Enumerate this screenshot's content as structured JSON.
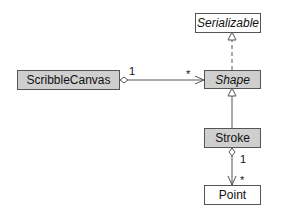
{
  "diagram": {
    "type": "UML class diagram",
    "classes": [
      {
        "id": "serializable",
        "name": "Serializable",
        "abstract": true,
        "kind": "interface"
      },
      {
        "id": "shape",
        "name": "Shape",
        "abstract": true
      },
      {
        "id": "scribble_canvas",
        "name": "ScribbleCanvas",
        "abstract": false
      },
      {
        "id": "stroke",
        "name": "Stroke",
        "abstract": false
      },
      {
        "id": "point",
        "name": "Point",
        "abstract": false
      }
    ],
    "relations": [
      {
        "type": "realization",
        "from": "Shape",
        "to": "Serializable"
      },
      {
        "type": "aggregation",
        "from": "ScribbleCanvas",
        "to": "Shape",
        "source_mult": "1",
        "target_mult": "*"
      },
      {
        "type": "generalization",
        "from": "Stroke",
        "to": "Shape"
      },
      {
        "type": "aggregation",
        "from": "Stroke",
        "to": "Point",
        "source_mult": "1",
        "target_mult": "*"
      }
    ]
  },
  "labels": {
    "serializable": "Serializable",
    "shape": "Shape",
    "scribble_canvas": "ScribbleCanvas",
    "stroke": "Stroke",
    "point": "Point",
    "canvas_mult_source": "1",
    "canvas_mult_target": "*",
    "stroke_mult_source": "1",
    "stroke_mult_target": "*"
  },
  "colors": {
    "concrete_fill": "#cfcfcf",
    "interface_fill": "#ffffff",
    "line": "#555555"
  }
}
